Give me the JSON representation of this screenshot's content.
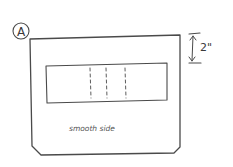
{
  "diagram": {
    "type": "hand-drawn panel sketch",
    "panel_label": "A",
    "dimension_label": "2\"",
    "surface_label": "smooth side",
    "inner_cutout": {
      "fold_lines": 3,
      "fold_line_style": "dashed"
    },
    "colors": {
      "ink": "#4a4a4a",
      "background": "#ffffff"
    }
  }
}
